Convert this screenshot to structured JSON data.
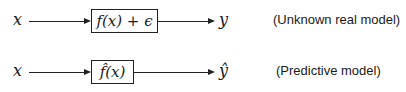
{
  "rows": [
    {
      "input": "x",
      "function": "f(x) + ϵ",
      "output": "y",
      "caption": "(Unknown real model)"
    },
    {
      "input": "x",
      "function": "f̂(x)",
      "output": "ŷ",
      "caption": "(Predictive model)"
    }
  ]
}
